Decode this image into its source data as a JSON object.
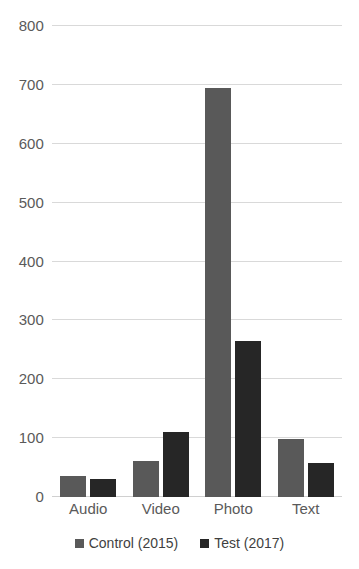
{
  "chart_data": {
    "type": "bar",
    "title": "",
    "subtitle": "",
    "xlabel": "",
    "ylabel": "",
    "categories": [
      "Audio",
      "Video",
      "Photo",
      "Text"
    ],
    "series": [
      {
        "name": "Control (2015)",
        "color": "#595959",
        "values": [
          36,
          62,
          695,
          99
        ]
      },
      {
        "name": "Test (2017)",
        "color": "#262626",
        "values": [
          30,
          111,
          265,
          57
        ]
      }
    ],
    "ylim": [
      0,
      800
    ],
    "y_ticks": [
      0,
      100,
      200,
      300,
      400,
      500,
      600,
      700,
      800
    ],
    "y_tick_labels": [
      "0",
      "100",
      "200",
      "300",
      "400",
      "500",
      "600",
      "700",
      "800"
    ],
    "grid": true,
    "grid_axis": "y",
    "legend": true,
    "legend_position": "bottom",
    "background": "#ffffff",
    "gridline_color": "#d9d9d9",
    "tick_label_color": "#5a5a5a"
  }
}
